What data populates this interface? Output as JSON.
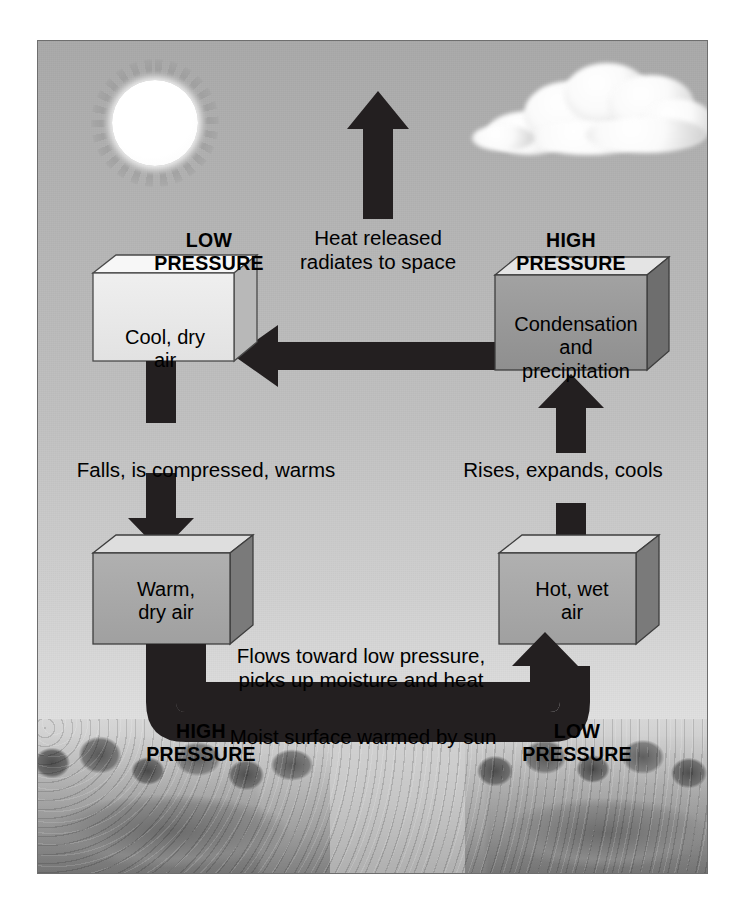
{
  "diagram": {
    "type": "flow-diagram",
    "background_gradient": [
      "#a9a9a9",
      "#e6e6e6"
    ],
    "frame_color": "#6e6e6e",
    "arrow_color": "#231f20"
  },
  "scenery": {
    "sun_label": "sun",
    "cloud_label": "cumulus-cloud",
    "landscape_label": "wooded-shoreline-photograph"
  },
  "pressure_labels": {
    "top_left": "LOW\nPRESSURE",
    "top_right": "HIGH\nPRESSURE",
    "bottom_left": "HIGH\nPRESSURE",
    "bottom_right": "LOW\nPRESSURE"
  },
  "boxes": [
    {
      "id": "cool-dry-air",
      "text": "Cool, dry\nair",
      "fill": "#e9e9e9",
      "top_face": "#f6f6f6",
      "side_face": "#b9b9b9"
    },
    {
      "id": "condensation-precipitation",
      "text": "Condensation\nand\nprecipitation",
      "fill": "#9a9a9a",
      "top_face": "#e2e2e2",
      "side_face": "#6f6f6f"
    },
    {
      "id": "warm-dry-air",
      "text": "Warm,\ndry air",
      "fill": "#a8a8a8",
      "top_face": "#dcdcdc",
      "side_face": "#7a7a7a"
    },
    {
      "id": "hot-wet-air",
      "text": "Hot, wet\nair",
      "fill": "#a8a8a8",
      "top_face": "#dcdcdc",
      "side_face": "#7a7a7a"
    }
  ],
  "process_labels": {
    "heat_released": "Heat released\nradiates to space",
    "falls_compressed": "Falls, is compressed, warms",
    "rises_expands": "Rises, expands, cools",
    "flows_toward": "Flows toward low pressure,\npicks up moisture and heat",
    "moist_surface": "Moist surface warmed by sun"
  },
  "arrows": [
    {
      "id": "arrow-to-space",
      "direction": "up",
      "description": "heat radiating to space"
    },
    {
      "id": "arrow-condensation-to-cool",
      "direction": "left",
      "description": "flow from condensation box to cool dry air box"
    },
    {
      "id": "arrow-cool-to-warm",
      "direction": "down",
      "description": "cool dry air falls and warms"
    },
    {
      "id": "arrow-hot-to-condensation",
      "direction": "up",
      "description": "hot wet air rises, expands, cools"
    },
    {
      "id": "arrow-surface-flow",
      "direction": "right",
      "description": "surface flow from high pressure toward low pressure"
    }
  ]
}
